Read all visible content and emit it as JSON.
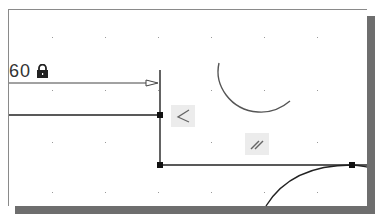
{
  "canvas": {
    "background": "#ffffff",
    "grid_color": "#9a9a9a",
    "line_color": "#222222",
    "arc_color": "#555555"
  },
  "dimension": {
    "value": "60",
    "locked": true,
    "icon": "lock-icon"
  },
  "constraints": [
    {
      "name": "perpendicular",
      "icon": "perpendicular-icon"
    },
    {
      "name": "parallel",
      "icon": "parallel-icon"
    }
  ]
}
